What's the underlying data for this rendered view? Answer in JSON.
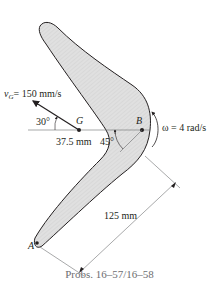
{
  "figure": {
    "labels": {
      "velocity": "v",
      "velocity_sub": "G",
      "velocity_value": "= 150 mm/s",
      "angle_30": "30°",
      "point_G": "G",
      "point_B": "B",
      "point_A": "A",
      "dist_GB": "37.5 mm",
      "angle_45": "45°",
      "omega": "ω = 4 rad/s",
      "dist_125": "125 mm"
    },
    "colors": {
      "body_fill": "#d9d9d9",
      "outline": "#231f20",
      "dimension_line": "#6d6e71",
      "caption": "#6d6e71"
    }
  },
  "caption": "Probs. 16–57/16–58"
}
